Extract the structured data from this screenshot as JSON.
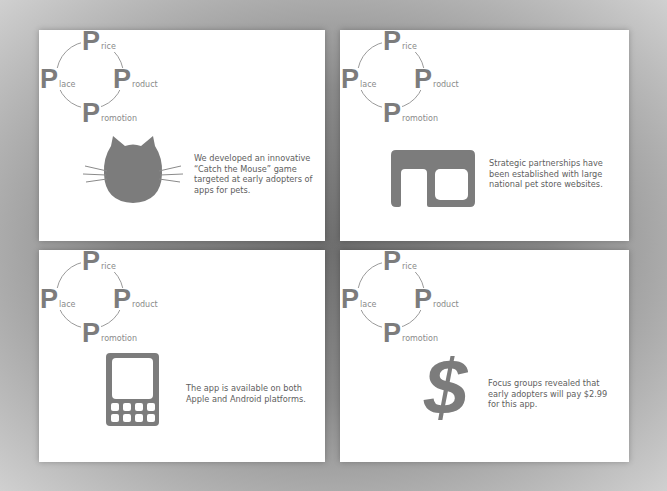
{
  "diagram": {
    "items": [
      {
        "initial": "P",
        "rest": "rice",
        "label": "Price"
      },
      {
        "initial": "P",
        "rest": "lace",
        "label": "Place"
      },
      {
        "initial": "P",
        "rest": "roduct",
        "label": "Product"
      },
      {
        "initial": "P",
        "rest": "romotion",
        "label": "Promotion"
      }
    ]
  },
  "panels": [
    {
      "id": "product",
      "icon": "cat-icon",
      "caption": "We developed an innovative “Catch the Mouse” game targeted at early adopters of apps for pets."
    },
    {
      "id": "place",
      "icon": "partnership-icon",
      "caption": "Strategic partnerships have been established with large national pet store websites."
    },
    {
      "id": "promotion",
      "icon": "phone-icon",
      "caption": "The app is available on both Apple and Android platforms."
    },
    {
      "id": "price",
      "icon": "dollar-icon",
      "caption": "Focus groups revealed that early adopters will pay $2.99 for this app."
    }
  ],
  "colors": {
    "icon_gray": "#7c7c7c",
    "text_gray": "#5e5e5e",
    "panel_bg": "#ffffff"
  }
}
